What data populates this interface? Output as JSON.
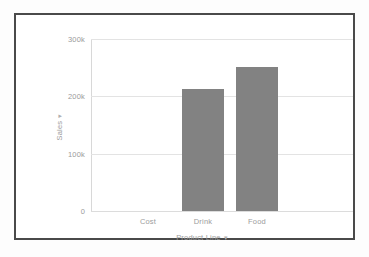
{
  "chart_data": {
    "type": "bar",
    "title": "",
    "categories": [
      "Cost",
      "Drink",
      "Food"
    ],
    "values": [
      0,
      212000,
      252000
    ],
    "series": [
      {
        "name": "Sales",
        "values": [
          0,
          212000,
          252000
        ]
      }
    ],
    "xlabel": "Product Line",
    "ylabel": "Sales",
    "ylim": [
      0,
      300000
    ],
    "yticks": [
      0,
      100000,
      200000,
      300000
    ],
    "ytick_labels": [
      "0",
      "100k",
      "200k",
      "300k"
    ],
    "grid": true,
    "legend": "none",
    "bar_color": "#828282",
    "gridline_color": "#e3e3e3",
    "tick_label_color": "#9a9a9a",
    "frame_color": "#4a4a4a",
    "background": "#ffffff"
  },
  "axes": {
    "y": {
      "title": "Sales",
      "caret": "▾",
      "ticks": [
        {
          "label": "300k",
          "value": 300000
        },
        {
          "label": "200k",
          "value": 200000
        },
        {
          "label": "100k",
          "value": 100000
        },
        {
          "label": "0",
          "value": 0
        }
      ]
    },
    "x": {
      "title": "Product Line",
      "caret": "▾",
      "ticks": [
        {
          "label": "Cost"
        },
        {
          "label": "Drink"
        },
        {
          "label": "Food"
        }
      ]
    }
  }
}
